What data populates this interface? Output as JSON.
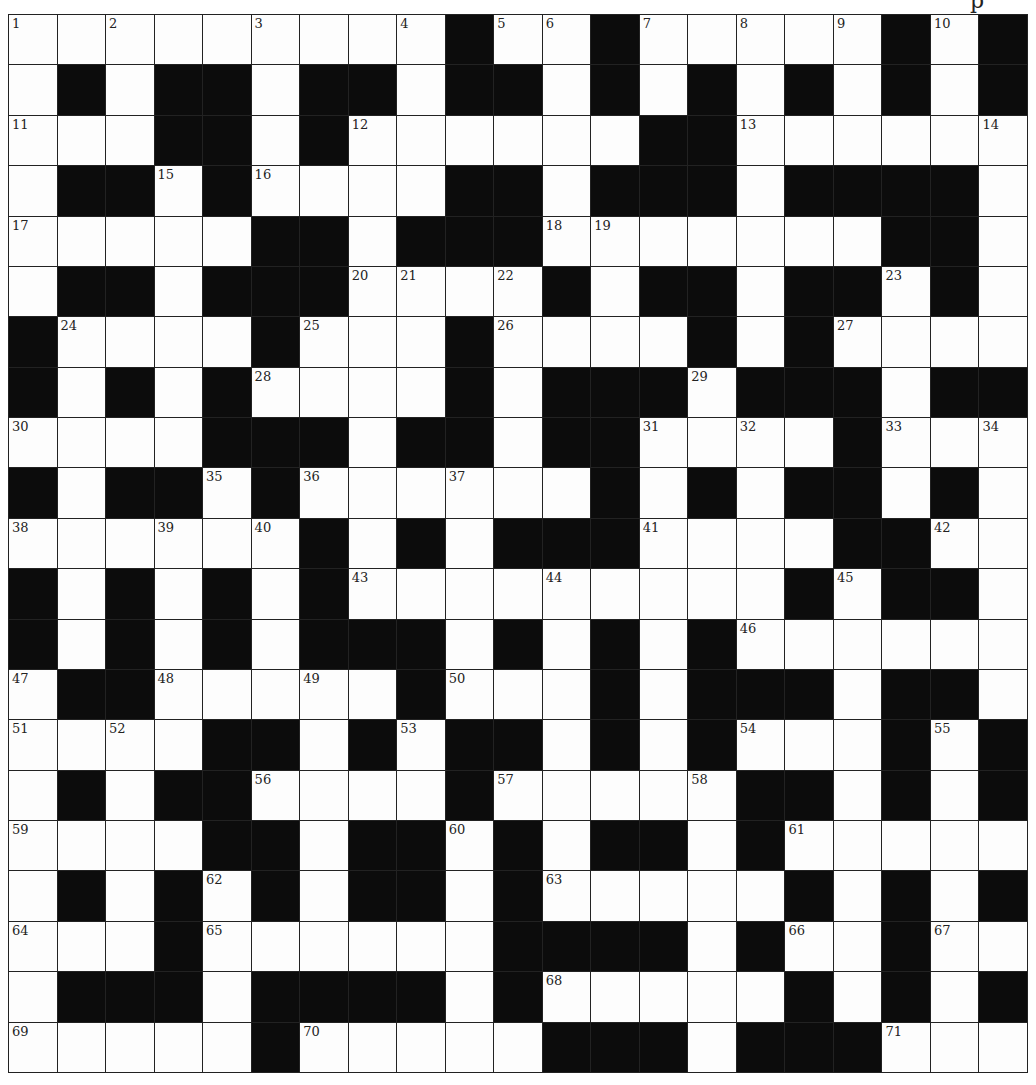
{
  "page": {
    "header_fragment": "p"
  },
  "puzzle": {
    "rows": 21,
    "cols": 21,
    "colors": {
      "block": "#0c0c0c",
      "cell": "#fdfdfd",
      "line": "#222222"
    },
    "layout": [
      "WWWWWWWWWBWWBWWWWWBWB",
      "WBWBBWBBWBBWBWBWBWBWB",
      "WWWBBWBWWWWWWBBWWWWWW",
      "WBBWBWWWWBBWBBBWBBBBW",
      "WWWWWBBWBBBWWWWWWWBBW",
      "WBBWBBBWWWWBWBBWBBWBW",
      "BWWWWBWWWBWWWWBWBWWWW",
      "BWBWBWWWWBWBBBWBBBWBB",
      "WWWWBBBWBBWBBWWWWBWWW",
      "BWBBWBWWWWWWBWBWBBWBW",
      "WWWWWWBWBWBBBWWWWBBWW",
      "BWBWBWBWWWWWWWWWBWBBW",
      "BWBWBWBBBWBWBWBWWWWWW",
      "WBBWWWWWBWWWBWBBBWBBW",
      "WWWWBBWBWBBWBWBWWWBWB",
      "WBWBBWWWWBWWWWWBBWBWB",
      "WWWWBBWBBWBWBBWBWWWWW",
      "WBWBWBWBBWBWWWWWBWBWB",
      "WWWBWWWWWWBBBBWBWWBWW",
      "WBBBWBBBBWBWWWWWBWBWB",
      "WWWWWBWWWWWBBBWBBBWWW"
    ],
    "numbers": [
      {
        "r": 0,
        "c": 0,
        "n": "1"
      },
      {
        "r": 0,
        "c": 2,
        "n": "2"
      },
      {
        "r": 0,
        "c": 5,
        "n": "3"
      },
      {
        "r": 0,
        "c": 8,
        "n": "4"
      },
      {
        "r": 0,
        "c": 10,
        "n": "5"
      },
      {
        "r": 0,
        "c": 11,
        "n": "6"
      },
      {
        "r": 0,
        "c": 13,
        "n": "7"
      },
      {
        "r": 0,
        "c": 15,
        "n": "8"
      },
      {
        "r": 0,
        "c": 17,
        "n": "9"
      },
      {
        "r": 0,
        "c": 19,
        "n": "10"
      },
      {
        "r": 2,
        "c": 0,
        "n": "11"
      },
      {
        "r": 2,
        "c": 7,
        "n": "12"
      },
      {
        "r": 2,
        "c": 15,
        "n": "13"
      },
      {
        "r": 2,
        "c": 20,
        "n": "14"
      },
      {
        "r": 3,
        "c": 3,
        "n": "15"
      },
      {
        "r": 3,
        "c": 5,
        "n": "16"
      },
      {
        "r": 4,
        "c": 0,
        "n": "17"
      },
      {
        "r": 4,
        "c": 11,
        "n": "18"
      },
      {
        "r": 4,
        "c": 12,
        "n": "19"
      },
      {
        "r": 5,
        "c": 7,
        "n": "20"
      },
      {
        "r": 5,
        "c": 8,
        "n": "21"
      },
      {
        "r": 5,
        "c": 10,
        "n": "22"
      },
      {
        "r": 5,
        "c": 18,
        "n": "23"
      },
      {
        "r": 6,
        "c": 1,
        "n": "24"
      },
      {
        "r": 6,
        "c": 6,
        "n": "25"
      },
      {
        "r": 6,
        "c": 10,
        "n": "26"
      },
      {
        "r": 6,
        "c": 17,
        "n": "27"
      },
      {
        "r": 7,
        "c": 5,
        "n": "28"
      },
      {
        "r": 7,
        "c": 14,
        "n": "29"
      },
      {
        "r": 8,
        "c": 0,
        "n": "30"
      },
      {
        "r": 8,
        "c": 13,
        "n": "31"
      },
      {
        "r": 8,
        "c": 15,
        "n": "32"
      },
      {
        "r": 8,
        "c": 18,
        "n": "33"
      },
      {
        "r": 8,
        "c": 20,
        "n": "34"
      },
      {
        "r": 9,
        "c": 4,
        "n": "35"
      },
      {
        "r": 9,
        "c": 6,
        "n": "36"
      },
      {
        "r": 9,
        "c": 9,
        "n": "37"
      },
      {
        "r": 10,
        "c": 0,
        "n": "38"
      },
      {
        "r": 10,
        "c": 3,
        "n": "39"
      },
      {
        "r": 10,
        "c": 5,
        "n": "40"
      },
      {
        "r": 10,
        "c": 13,
        "n": "41"
      },
      {
        "r": 10,
        "c": 19,
        "n": "42"
      },
      {
        "r": 11,
        "c": 7,
        "n": "43"
      },
      {
        "r": 11,
        "c": 11,
        "n": "44"
      },
      {
        "r": 11,
        "c": 17,
        "n": "45"
      },
      {
        "r": 12,
        "c": 15,
        "n": "46"
      },
      {
        "r": 13,
        "c": 0,
        "n": "47"
      },
      {
        "r": 13,
        "c": 3,
        "n": "48"
      },
      {
        "r": 13,
        "c": 6,
        "n": "49"
      },
      {
        "r": 13,
        "c": 9,
        "n": "50"
      },
      {
        "r": 14,
        "c": 0,
        "n": "51"
      },
      {
        "r": 14,
        "c": 2,
        "n": "52"
      },
      {
        "r": 14,
        "c": 8,
        "n": "53"
      },
      {
        "r": 14,
        "c": 15,
        "n": "54"
      },
      {
        "r": 14,
        "c": 19,
        "n": "55"
      },
      {
        "r": 15,
        "c": 5,
        "n": "56"
      },
      {
        "r": 15,
        "c": 10,
        "n": "57"
      },
      {
        "r": 15,
        "c": 14,
        "n": "58"
      },
      {
        "r": 16,
        "c": 0,
        "n": "59"
      },
      {
        "r": 16,
        "c": 9,
        "n": "60"
      },
      {
        "r": 16,
        "c": 16,
        "n": "61"
      },
      {
        "r": 17,
        "c": 4,
        "n": "62"
      },
      {
        "r": 17,
        "c": 11,
        "n": "63"
      },
      {
        "r": 18,
        "c": 0,
        "n": "64"
      },
      {
        "r": 18,
        "c": 4,
        "n": "65"
      },
      {
        "r": 18,
        "c": 16,
        "n": "66"
      },
      {
        "r": 18,
        "c": 19,
        "n": "67"
      },
      {
        "r": 19,
        "c": 11,
        "n": "68"
      },
      {
        "r": 20,
        "c": 0,
        "n": "69"
      },
      {
        "r": 20,
        "c": 6,
        "n": "70"
      },
      {
        "r": 20,
        "c": 18,
        "n": "71"
      }
    ]
  }
}
